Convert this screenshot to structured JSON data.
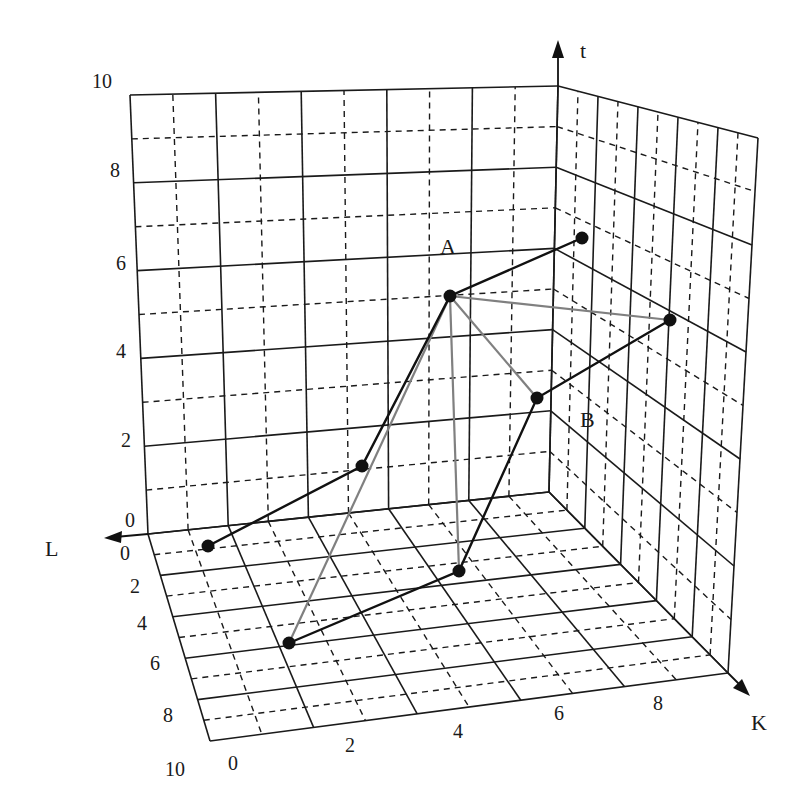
{
  "figure": {
    "axes": {
      "t": {
        "label": "t",
        "ticks": [
          "0",
          "2",
          "4",
          "6",
          "8",
          "10"
        ]
      },
      "L": {
        "label": "L",
        "ticks": [
          "0",
          "2",
          "4",
          "6",
          "8",
          "10"
        ]
      },
      "K": {
        "label": "K",
        "ticks": [
          "0",
          "2",
          "4",
          "6",
          "8"
        ]
      }
    },
    "point_labels": {
      "A": "A",
      "B": "B"
    },
    "colors": {
      "grid": "#1a1a1a",
      "path": "#111111",
      "rays": "#808080",
      "background": "#ffffff"
    }
  },
  "diagram": {
    "type": "3d-grid-path",
    "points_px": {
      "A": [
        450,
        296
      ],
      "top_right": [
        582,
        238
      ],
      "right": [
        670,
        320
      ],
      "B": [
        537,
        398
      ],
      "mid_left": [
        362,
        466
      ],
      "floor_left": [
        208,
        546
      ],
      "floor_front": [
        289,
        643
      ],
      "floor_mid": [
        459,
        571
      ]
    },
    "black_path": [
      "floor_left",
      "mid_left",
      "A",
      "top_right"
    ],
    "black_path_2": [
      "floor_front",
      "floor_mid",
      "B",
      "right"
    ],
    "gray_rays_from_A": [
      "right",
      "B",
      "floor_mid",
      "floor_front"
    ]
  }
}
